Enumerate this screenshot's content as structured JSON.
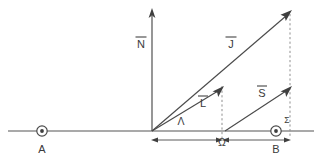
{
  "figure": {
    "type": "physics-vector-diagram",
    "background_color": "#ffffff",
    "line_color": "#4a4a4a",
    "dashed_color": "#8f8f8f",
    "text_color": "#3a3a3a"
  },
  "vectors": [
    {
      "id": "N",
      "label": "N",
      "overbar": true,
      "from": [
        152,
        131
      ],
      "to": [
        152,
        11
      ],
      "direction": "vertical-up",
      "label_pos": [
        141,
        43
      ]
    },
    {
      "id": "J",
      "label": "J",
      "overbar": true,
      "from": [
        152,
        131
      ],
      "to": [
        290,
        12
      ],
      "direction": "diagonal-up-right",
      "label_pos": [
        231,
        45
      ]
    },
    {
      "id": "L",
      "label": "L",
      "overbar": true,
      "from": [
        152,
        131
      ],
      "to": [
        222,
        88
      ],
      "direction": "diagonal-up-right",
      "label_pos": [
        203,
        104
      ]
    },
    {
      "id": "S",
      "label": "S",
      "overbar": true,
      "from": [
        225,
        131
      ],
      "to": [
        290,
        88
      ],
      "direction": "diagonal-up-right",
      "label_pos": [
        262,
        94
      ]
    }
  ],
  "points": [
    {
      "id": "A",
      "label": "A",
      "marker": "circled-dot",
      "at": [
        42,
        131
      ],
      "label_pos": [
        42,
        150
      ]
    },
    {
      "id": "B",
      "label": "B",
      "marker": "circled-dot",
      "at": [
        276,
        131
      ],
      "label_pos": [
        276,
        150
      ]
    }
  ],
  "greek_labels": [
    {
      "id": "Lambda",
      "label": "Λ",
      "at": [
        181,
        122
      ]
    },
    {
      "id": "Omega",
      "label": "Ω",
      "at": [
        222,
        143
      ]
    },
    {
      "id": "Sigma",
      "label": "Σ",
      "at": [
        287,
        121
      ]
    }
  ],
  "axis": {
    "id": "horizontal-axis",
    "from": [
      8,
      131
    ],
    "to": [
      314,
      131
    ]
  },
  "dashed_guides": [
    {
      "id": "L-tip-drop",
      "from": [
        222,
        88
      ],
      "to": [
        222,
        137
      ]
    },
    {
      "id": "J-tip-drop",
      "from": [
        290,
        12
      ],
      "to": [
        290,
        137
      ]
    }
  ],
  "measurements": [
    {
      "id": "omega-span",
      "from": [
        153,
        140
      ],
      "to": [
        222,
        140
      ],
      "style": "double-arrow"
    },
    {
      "id": "b-span",
      "from": [
        222,
        140
      ],
      "to": [
        290,
        140
      ],
      "style": "double-arrow"
    }
  ]
}
